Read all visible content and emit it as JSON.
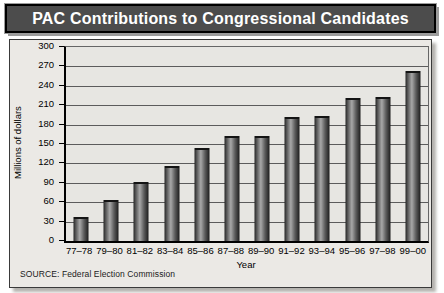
{
  "title": "PAC Contributions to Congressional Candidates",
  "source_note": "SOURCE: Federal Election Commission",
  "chart_data": {
    "type": "bar",
    "title": "PAC Contributions to Congressional Candidates",
    "categories": [
      "77–78",
      "79–80",
      "81–82",
      "83–84",
      "85–86",
      "87–88",
      "89–90",
      "91–92",
      "93–94",
      "95–96",
      "97–98",
      "99–00"
    ],
    "values": [
      34,
      61,
      88,
      113,
      140,
      159,
      160,
      188,
      190,
      218,
      220,
      260
    ],
    "xlabel": "Year",
    "ylabel": "Millions of dollars",
    "ylim": [
      0,
      300
    ],
    "ytick_step": 30,
    "grid": true,
    "legend_position": "none",
    "colors": {
      "title_bar_bg": "#4c4c4c",
      "title_text": "#ffffff",
      "card_bg": "#ebe9e5",
      "plot_bg": "#e7e6e2",
      "bar_edge": "#242424",
      "bar_highlight": "#a8a8a8",
      "gridline": "#5c5c5c"
    }
  }
}
